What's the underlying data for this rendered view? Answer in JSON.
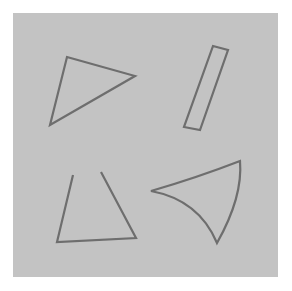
{
  "figure": {
    "page_background": "#ffffff",
    "canvas": {
      "name": "gray-panel",
      "fill": "#c3c3c3",
      "x": 13,
      "y": 13,
      "width": 265,
      "height": 264
    },
    "stroke": {
      "color": "#6e6e6e",
      "width": 2.2,
      "linejoin": "miter",
      "linecap": "butt"
    },
    "shape_count": 4,
    "shapes": [
      {
        "id": "triangle-top-left",
        "label": "Triangle",
        "kind": "polygon",
        "closed": true,
        "fill": "none",
        "vertices": [
          [
            67,
            57
          ],
          [
            135,
            76
          ],
          [
            50,
            125
          ]
        ],
        "path": "M 67 57 L 135 76 L 50 125 Z"
      },
      {
        "id": "rectangle-top-right",
        "label": "Tilted rectangle",
        "kind": "polygon",
        "closed": true,
        "fill": "none",
        "vertices": [
          [
            213,
            46
          ],
          [
            228,
            50
          ],
          [
            200,
            130
          ],
          [
            184,
            127
          ]
        ],
        "path": "M 213 46 L 228 50 L 200 130 L 184 127 Z"
      },
      {
        "id": "triangle-bottom-left-open",
        "label": "Open triangle",
        "kind": "polyline",
        "closed": false,
        "fill": "none",
        "vertices": [
          [
            73,
            175
          ],
          [
            57,
            242
          ],
          [
            136,
            238
          ],
          [
            101,
            172
          ]
        ],
        "path": "M 73 175 L 57 242 L 136 238 L 101 172"
      },
      {
        "id": "curved-triangle-bottom-right",
        "label": "Concave curved triangle",
        "kind": "curved-polygon",
        "closed": true,
        "fill": "none",
        "cusps": [
          [
            240,
            161
          ],
          [
            151,
            191
          ],
          [
            217,
            243
          ]
        ],
        "path": "M 240 161 Q 196 178 151 191 Q 199 200 217 243 Q 243 197 240 161 Z"
      }
    ]
  }
}
